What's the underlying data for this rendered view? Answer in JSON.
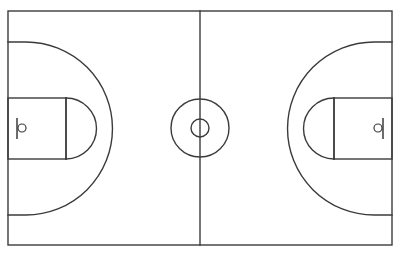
{
  "figure": {
    "title": "Basketball Court Diagram",
    "caption": "Full basketball court, top-down schematic view",
    "background_color": "#ffffff",
    "line_color": "#3b3b3b",
    "line_width": 1.4,
    "canvas": {
      "width": 400,
      "height": 257
    }
  },
  "court": {
    "label": "court-boundary",
    "geometry": {
      "x": 8,
      "y": 11,
      "width": 384,
      "height": 234
    },
    "center": {
      "x": 200,
      "y": 128
    }
  },
  "division_line": {
    "label": "half-court-line",
    "geometry": {
      "x": 200,
      "y1": 11,
      "y2": 245
    }
  },
  "center_circle": {
    "label": "center-circle",
    "outer_radius": 29,
    "inner_radius": 9,
    "center": {
      "x": 200,
      "y": 128
    }
  },
  "halves": [
    {
      "side": "left",
      "key": {
        "label": "left-key",
        "geometry": {
          "x": 8,
          "y": 98,
          "width": 58,
          "height": 61
        }
      },
      "free_throw_line": {
        "label": "left-free-throw-line",
        "geometry": {
          "x": 66,
          "y1": 98,
          "y2": 159
        }
      },
      "free_throw_circle": {
        "label": "left-free-throw-semicircle",
        "center": {
          "x": 66,
          "y": 128
        },
        "radius": 30,
        "bulge": "right"
      },
      "three_point_arc": {
        "label": "left-three-point-arc",
        "center": {
          "x": 26,
          "y": 128
        },
        "radius": 62,
        "sideline_top_y": 42,
        "sideline_bottom_y": 215,
        "apex_x": 88
      },
      "backboard": {
        "label": "left-backboard",
        "geometry": {
          "x": 17,
          "y1": 118,
          "y2": 139
        }
      },
      "hoop": {
        "label": "left-hoop",
        "center": {
          "x": 22,
          "y": 128
        },
        "radius": 4
      }
    },
    {
      "side": "right",
      "key": {
        "label": "right-key",
        "geometry": {
          "x": 334,
          "y": 98,
          "width": 58,
          "height": 61
        }
      },
      "free_throw_line": {
        "label": "right-free-throw-line",
        "geometry": {
          "x": 334,
          "y1": 98,
          "y2": 159
        }
      },
      "free_throw_circle": {
        "label": "right-free-throw-semicircle",
        "center": {
          "x": 334,
          "y": 128
        },
        "radius": 30,
        "bulge": "left"
      },
      "three_point_arc": {
        "label": "right-three-point-arc",
        "center": {
          "x": 374,
          "y": 128
        },
        "radius": 62,
        "sideline_top_y": 42,
        "sideline_bottom_y": 215,
        "apex_x": 312
      },
      "backboard": {
        "label": "right-backboard",
        "geometry": {
          "x": 383,
          "y1": 118,
          "y2": 139
        }
      },
      "hoop": {
        "label": "right-hoop",
        "center": {
          "x": 378,
          "y": 128
        },
        "radius": 4
      }
    }
  ]
}
